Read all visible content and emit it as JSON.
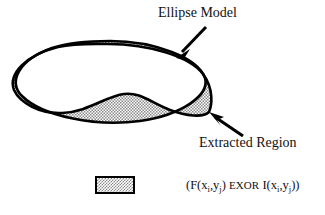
{
  "figure": {
    "type": "diagram",
    "background_color": "#ffffff",
    "stroke_color": "#000000",
    "shade_color": "#8a8a8a",
    "annotations": [
      {
        "name": "ellipse-model",
        "label": "Ellipse Model",
        "arrow_from": [
          206,
          27
        ],
        "arrow_to": [
          176,
          58
        ]
      },
      {
        "name": "extracted-region",
        "label": "Extracted Region",
        "arrow_from": [
          243,
          136
        ],
        "arrow_to": [
          209,
          112
        ]
      }
    ]
  },
  "legend": {
    "swatch_name": "xor-region-swatch",
    "swatch_fill": "#8a8a8a",
    "swatch_border": "#000000",
    "text_full": "(F(xi,yj) EXOR I(xi,yj))",
    "parts": {
      "open": "(F(x",
      "sub_i_1": "i",
      "comma_1": ",y",
      "sub_j_1": "j",
      "close_1": ") ",
      "operator": "EXOR",
      "mid": " I(x",
      "sub_i_2": "i",
      "comma_2": ",y",
      "sub_j_2": "j",
      "close_2": "))"
    }
  }
}
